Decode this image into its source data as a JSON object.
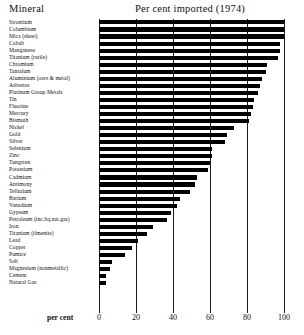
{
  "header": {
    "left_label": "Mineral",
    "title": "Per cent imported (1974)"
  },
  "axis": {
    "name": "per cent",
    "ticks": [
      "0",
      "20",
      "40",
      "60",
      "80",
      "100"
    ]
  },
  "chart_data": {
    "type": "bar",
    "orientation": "horizontal",
    "title": "Per cent imported (1974)",
    "xlabel": "per cent",
    "ylabel": "Mineral",
    "xlim": [
      0,
      100
    ],
    "grid": true,
    "legend": null,
    "categories": [
      "Strontium",
      "Columbium",
      "Mica (sheet)",
      "Cobalt",
      "Manganese",
      "Titanium (rutile)",
      "Chromium",
      "Tantalum",
      "Aluminium (ores & metal)",
      "Asbestos",
      "Platinum Group Metals",
      "Tin",
      "Fluorine",
      "Mercury",
      "Bismuth",
      "Nickel",
      "Gold",
      "Silver",
      "Selenium",
      "Zinc",
      "Tungsten",
      "Potassium",
      "Cadmium",
      "Antimony",
      "Tellurium",
      "Barium",
      "Vanadium",
      "Gypsum",
      "Petroleum (inc.liq.nat.gas)",
      "Iron",
      "Titanium (ilmenite)",
      "Lead",
      "Copper",
      "Pumice",
      "Salt",
      "Magnesium (nonmetallic)",
      "Cement",
      "Natural Gas"
    ],
    "values": [
      100,
      100,
      100,
      98,
      98,
      97,
      91,
      90,
      88,
      87,
      86,
      84,
      83,
      82,
      81,
      73,
      69,
      68,
      61,
      61,
      60,
      59,
      53,
      52,
      49,
      44,
      42,
      39,
      37,
      29,
      26,
      21,
      18,
      14,
      7,
      6,
      4,
      4
    ]
  }
}
